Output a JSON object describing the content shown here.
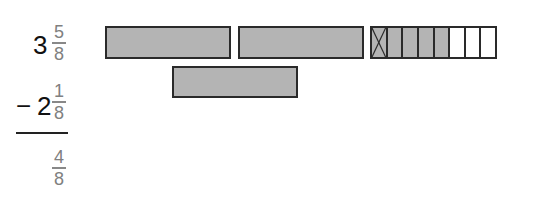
{
  "problem": {
    "minuend": {
      "whole": "3",
      "numerator": "5",
      "denominator": "8"
    },
    "subtrahend": {
      "sign": "−",
      "whole": "2",
      "numerator": "1",
      "denominator": "8"
    },
    "difference": {
      "numerator": "4",
      "denominator": "8"
    }
  },
  "model": {
    "whole_bars": 2,
    "fraction_bar": {
      "total_parts": 8,
      "shaded_parts": 5,
      "crossed_out_parts": 1
    },
    "subtracted_whole_bars": 1
  },
  "colors": {
    "shaded": "#b4b4b4",
    "border": "#2a2a2a",
    "fraction_text": "#808080",
    "whole_text": "#111111"
  }
}
